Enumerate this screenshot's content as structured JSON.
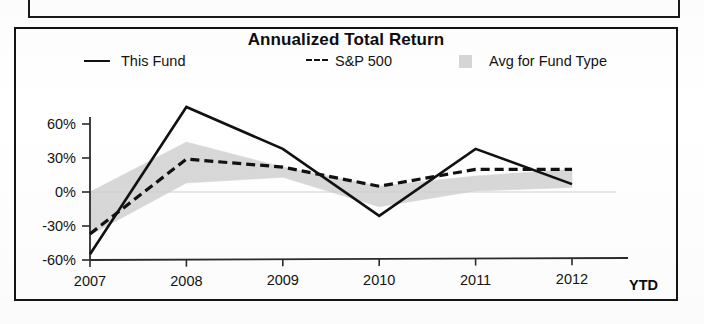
{
  "panel": {
    "top_panel_name": "partial-panel-above"
  },
  "chart_data": {
    "type": "line",
    "title": "Annualized Total Return",
    "xlabel": "",
    "ylabel": "",
    "categories": [
      "2007",
      "2008",
      "2009",
      "2010",
      "2011",
      "2012"
    ],
    "x_suffix_label": "YTD",
    "ytick_labels": [
      "60%",
      "30%",
      "0%",
      "-30%",
      "-60%"
    ],
    "ytick_values": [
      60,
      30,
      0,
      -30,
      -60
    ],
    "ylim": [
      -60,
      85
    ],
    "grid": false,
    "legend_position": "top",
    "series": [
      {
        "name": "This Fund",
        "style": "solid",
        "color": "#111111",
        "values": [
          -55,
          75,
          38,
          -21,
          38,
          7
        ]
      },
      {
        "name": "S&P 500",
        "style": "dashed",
        "color": "#111111",
        "values": [
          -37,
          29,
          22,
          5,
          20,
          20
        ]
      },
      {
        "name": "Avg for Fund Type",
        "style": "band",
        "color": "#d8d8d8",
        "band_upper": [
          0,
          44,
          22,
          5,
          14,
          20
        ],
        "band_lower": [
          -38,
          8,
          13,
          -13,
          1,
          4
        ]
      }
    ]
  },
  "legend": {
    "items": [
      {
        "label": "This Fund",
        "marker": "solid-line-swatch"
      },
      {
        "label": "S&P 500",
        "marker": "dashed-line-swatch"
      },
      {
        "label": "Avg for Fund Type",
        "marker": "gray-box-swatch"
      }
    ]
  },
  "colors": {
    "line": "#111111",
    "band": "#d8d8d8",
    "axis": "#333333",
    "frame": "#141414"
  }
}
